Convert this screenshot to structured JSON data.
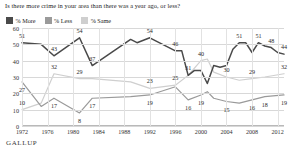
{
  "title": "Is there more crime in your area than there was a year ago, or less?",
  "source": "GALLUP",
  "colors": {
    "more": "#4a4a4a",
    "less": "#9a9a9a",
    "same": "#cfcfcf",
    "grid": "#d8d8d8",
    "text": "#1d1d1d"
  },
  "legend": [
    {
      "label": "% More",
      "color": "#4a4a4a",
      "key": "more"
    },
    {
      "label": "% Less",
      "color": "#9a9a9a",
      "key": "less"
    },
    {
      "label": "% Same",
      "color": "#cfcfcf",
      "key": "same"
    }
  ],
  "chart_data": {
    "type": "line",
    "title": "Is there more crime in your area than there was a year ago, or less?",
    "xlabel": "",
    "ylabel": "",
    "ylim": [
      0,
      60
    ],
    "yticks": [
      0,
      10,
      20,
      30,
      40,
      50,
      60
    ],
    "xlim": [
      1972,
      2013
    ],
    "xticks": [
      1972,
      1976,
      1980,
      1984,
      1988,
      1992,
      1996,
      2000,
      2004,
      2008,
      2012
    ],
    "grid": true,
    "legend_position": "top-left",
    "series": [
      {
        "name": "% More",
        "color": "#4a4a4a",
        "points": [
          {
            "x": 1972,
            "y": 51,
            "label": "51"
          },
          {
            "x": 1975,
            "y": 50,
            "label": ""
          },
          {
            "x": 1977,
            "y": 43,
            "label": "43"
          },
          {
            "x": 1981,
            "y": 54,
            "label": "54"
          },
          {
            "x": 1983,
            "y": 37,
            "label": "37"
          },
          {
            "x": 1989,
            "y": 53,
            "label": ""
          },
          {
            "x": 1990,
            "y": 51,
            "label": ""
          },
          {
            "x": 1992,
            "y": 54,
            "label": "54"
          },
          {
            "x": 1993,
            "y": 52,
            "label": ""
          },
          {
            "x": 1996,
            "y": 46,
            "label": "46"
          },
          {
            "x": 1997,
            "y": 46,
            "label": ""
          },
          {
            "x": 1998,
            "y": 31,
            "label": "31"
          },
          {
            "x": 1999,
            "y": 34,
            "label": ""
          },
          {
            "x": 2000,
            "y": 34,
            "label": ""
          },
          {
            "x": 2001,
            "y": 26,
            "label": ""
          },
          {
            "x": 2002,
            "y": 37,
            "label": ""
          },
          {
            "x": 2003,
            "y": 36,
            "label": ""
          },
          {
            "x": 2004,
            "y": 37,
            "label": ""
          },
          {
            "x": 2005,
            "y": 47,
            "label": ""
          },
          {
            "x": 2006,
            "y": 51,
            "label": "51"
          },
          {
            "x": 2007,
            "y": 51,
            "label": ""
          },
          {
            "x": 2008,
            "y": 45,
            "label": ""
          },
          {
            "x": 2009,
            "y": 51,
            "label": "51"
          },
          {
            "x": 2010,
            "y": 49,
            "label": ""
          },
          {
            "x": 2011,
            "y": 48,
            "label": "48"
          },
          {
            "x": 2012,
            "y": 45,
            "label": ""
          },
          {
            "x": 2013,
            "y": 44,
            "label": "44"
          }
        ]
      },
      {
        "name": "% Same",
        "color": "#cfcfcf",
        "points": [
          {
            "x": 1972,
            "y": 10,
            "label": "10"
          },
          {
            "x": 1975,
            "y": 14,
            "label": ""
          },
          {
            "x": 1977,
            "y": 32,
            "label": "32"
          },
          {
            "x": 1981,
            "y": 29,
            "label": "29"
          },
          {
            "x": 1983,
            "y": 29,
            "label": ""
          },
          {
            "x": 1989,
            "y": 27,
            "label": ""
          },
          {
            "x": 1992,
            "y": 23,
            "label": "23"
          },
          {
            "x": 1996,
            "y": 25,
            "label": "25"
          },
          {
            "x": 1998,
            "y": 31,
            "label": ""
          },
          {
            "x": 2000,
            "y": 40,
            "label": "40"
          },
          {
            "x": 2001,
            "y": 41,
            "label": ""
          },
          {
            "x": 2002,
            "y": 33,
            "label": ""
          },
          {
            "x": 2004,
            "y": 30,
            "label": "30"
          },
          {
            "x": 2006,
            "y": 28,
            "label": ""
          },
          {
            "x": 2008,
            "y": 29,
            "label": "29"
          },
          {
            "x": 2010,
            "y": 30,
            "label": ""
          },
          {
            "x": 2013,
            "y": 32,
            "label": "32"
          }
        ]
      },
      {
        "name": "% Less",
        "color": "#9a9a9a",
        "points": [
          {
            "x": 1972,
            "y": 27,
            "label": "27"
          },
          {
            "x": 1975,
            "y": 12,
            "label": ""
          },
          {
            "x": 1977,
            "y": 17,
            "label": "17"
          },
          {
            "x": 1981,
            "y": 8,
            "label": "8"
          },
          {
            "x": 1983,
            "y": 17,
            "label": "17"
          },
          {
            "x": 1989,
            "y": 18,
            "label": ""
          },
          {
            "x": 1992,
            "y": 19,
            "label": "19"
          },
          {
            "x": 1996,
            "y": 24,
            "label": ""
          },
          {
            "x": 1998,
            "y": 16,
            "label": "16"
          },
          {
            "x": 2000,
            "y": 19,
            "label": "19"
          },
          {
            "x": 2001,
            "y": 21,
            "label": ""
          },
          {
            "x": 2002,
            "y": 17,
            "label": ""
          },
          {
            "x": 2004,
            "y": 15,
            "label": "15"
          },
          {
            "x": 2006,
            "y": 14,
            "label": ""
          },
          {
            "x": 2008,
            "y": 16,
            "label": "16"
          },
          {
            "x": 2010,
            "y": 18,
            "label": "18"
          },
          {
            "x": 2013,
            "y": 19,
            "label": "19"
          }
        ]
      }
    ]
  }
}
